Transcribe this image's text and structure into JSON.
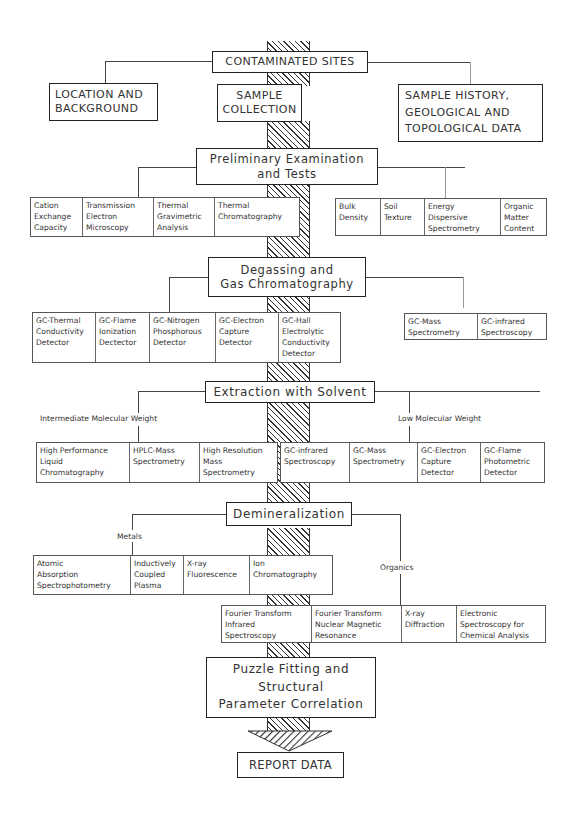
{
  "diagram": {
    "title_box": "CONTAMINATED SITES",
    "top_branches": {
      "left": [
        "LOCATION AND",
        "BACKGROUND"
      ],
      "center": [
        "SAMPLE",
        "COLLECTION"
      ],
      "right": [
        "SAMPLE HISTORY,",
        "GEOLOGICAL AND",
        "TOPOLOGICAL DATA"
      ]
    },
    "stages": [
      {
        "id": "preliminary",
        "title": [
          "Preliminary Examination",
          "and Tests"
        ],
        "left_methods": [
          [
            "Cation",
            "Exchange",
            "Capacity"
          ],
          [
            "Transmission",
            "Electron",
            "Microscopy"
          ],
          [
            "Thermal",
            "Gravimetric",
            "Analysis"
          ],
          [
            "Thermal",
            "Chromatography"
          ]
        ],
        "right_methods": [
          [
            "Bulk",
            "Density"
          ],
          [
            "Soil",
            "Texture"
          ],
          [
            "Energy",
            "Dispersive",
            "Spectrometry"
          ],
          [
            "Organic",
            "Matter",
            "Content"
          ]
        ]
      },
      {
        "id": "degassing",
        "title": [
          "Degassing and",
          "Gas Chromatography"
        ],
        "left_methods": [
          [
            "GC-Thermal",
            "Conductivity",
            "Detector"
          ],
          [
            "GC-Flame",
            "Ionization",
            "Dectector"
          ],
          [
            "GC-Nitrogen",
            "Phosphorous",
            "Detector"
          ],
          [
            "GC-Electron",
            "Capture",
            "Detector"
          ],
          [
            "GC-Hall",
            "Electrolytic",
            "Conductivity",
            "Detector"
          ]
        ],
        "right_methods": [
          [
            "GC-Mass",
            "Spectrometry"
          ],
          [
            "GC-infrared",
            "Spectroscopy"
          ]
        ]
      },
      {
        "id": "extraction",
        "title": [
          "Extraction with Solvent"
        ],
        "left_label": "Intermediate Molecular Weight",
        "right_label": "Low Molecular Weight",
        "left_methods": [
          [
            "High Performance",
            "Liquid",
            "Chromatography"
          ],
          [
            "HPLC-Mass",
            "Spectrometry"
          ],
          [
            "High Resolution",
            "Mass",
            "Spectrometry"
          ]
        ],
        "right_methods": [
          [
            "GC-infrared",
            "Spectroscopy"
          ],
          [
            "GC-Mass",
            "Spectrometry"
          ],
          [
            "GC-Electron",
            "Capture",
            "Detector"
          ],
          [
            "GC-Flame",
            "Photometric",
            "Detector"
          ]
        ]
      },
      {
        "id": "demineralization",
        "title": [
          "Demineralization"
        ],
        "left_label": "Metals",
        "right_label": "Organics",
        "left_methods": [
          [
            "Atomic",
            "Absorption",
            "Spectrophotometry"
          ],
          [
            "Inductively",
            "Coupled",
            "Plasma"
          ],
          [
            "X-ray",
            "Fluorescence"
          ],
          [
            "Ion",
            "Chromatography"
          ]
        ],
        "right_methods": [
          [
            "Fourier Transform",
            "Infrared",
            "Spectroscopy"
          ],
          [
            "Fourier Transform",
            "Nuclear Magnetic",
            "Resonance"
          ],
          [
            "X-ray",
            "Diffraction"
          ],
          [
            "Electronic",
            "Spectroscopy for",
            "Chemical Analysis"
          ]
        ]
      }
    ],
    "final_stage": [
      "Puzzle Fitting and",
      "Structural",
      "Parameter Correlation"
    ],
    "output_box": "REPORT DATA"
  }
}
